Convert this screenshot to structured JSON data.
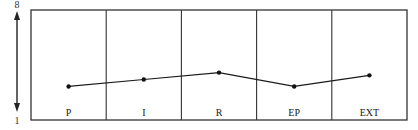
{
  "chart_data": {
    "type": "line",
    "title": "",
    "xlabel": "",
    "ylabel": "",
    "categories": [
      "P",
      "I",
      "R",
      "EP",
      "EXT"
    ],
    "series": [
      {
        "name": "profile",
        "values": [
          2.7,
          3.2,
          3.7,
          2.7,
          3.5
        ]
      }
    ],
    "ylim": [
      1,
      8
    ],
    "y_axis_labels": {
      "top": "8",
      "bottom": "1"
    },
    "y_axis_style": "double-headed arrow",
    "grid": "vertical column dividers",
    "legend": "none",
    "colors": {
      "line": "#1a1a1a",
      "frame": "#333333",
      "marker": "#111111"
    }
  }
}
